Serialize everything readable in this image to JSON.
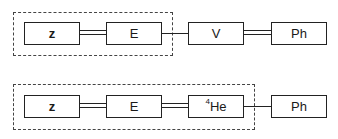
{
  "diagram": {
    "rows": [
      {
        "nodes": [
          {
            "id": "z",
            "label": "z"
          },
          {
            "id": "E",
            "label": "E"
          },
          {
            "id": "V",
            "label": "V"
          },
          {
            "id": "Ph",
            "label": "Ph"
          }
        ],
        "connections": [
          {
            "from": "z",
            "to": "E",
            "style": "double"
          },
          {
            "from": "E",
            "to": "V",
            "style": "single"
          },
          {
            "from": "V",
            "to": "Ph",
            "style": "double"
          }
        ],
        "dashed_group": [
          "z",
          "E"
        ]
      },
      {
        "nodes": [
          {
            "id": "z",
            "label": "z"
          },
          {
            "id": "E",
            "label": "E"
          },
          {
            "id": "He4",
            "label_sup": "4",
            "label": "He"
          },
          {
            "id": "Ph",
            "label": "Ph"
          }
        ],
        "connections": [
          {
            "from": "z",
            "to": "E",
            "style": "double"
          },
          {
            "from": "E",
            "to": "He4",
            "style": "double"
          },
          {
            "from": "He4",
            "to": "Ph",
            "style": "single"
          }
        ],
        "dashed_group": [
          "z",
          "E",
          "He4"
        ]
      }
    ]
  }
}
